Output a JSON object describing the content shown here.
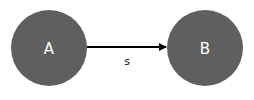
{
  "diagram": {
    "nodes": [
      {
        "id": "A",
        "label": "A",
        "cx": 49,
        "cy": 48,
        "r": 38,
        "color": "#5f5f5f"
      },
      {
        "id": "B",
        "label": "B",
        "cx": 205,
        "cy": 48,
        "r": 38,
        "color": "#5f5f5f"
      }
    ],
    "edges": [
      {
        "from": "A",
        "to": "B",
        "label": "s",
        "color": "#000000"
      }
    ]
  }
}
